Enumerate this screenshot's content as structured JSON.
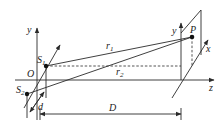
{
  "diagram": {
    "title": "",
    "labels": {
      "y_left": "y",
      "origin": "O",
      "s1": "S",
      "s1_sub": "1",
      "s2": "S",
      "s2_sub": "2",
      "d": "d",
      "r1": "r",
      "r1_sub": "1",
      "r2": "r",
      "r2_sub": "2",
      "y_right": "y",
      "p": "P",
      "x": "x",
      "z": "z",
      "D": "D"
    },
    "colors": {
      "line": "#2a2a2a",
      "background": "#ffffff"
    }
  }
}
